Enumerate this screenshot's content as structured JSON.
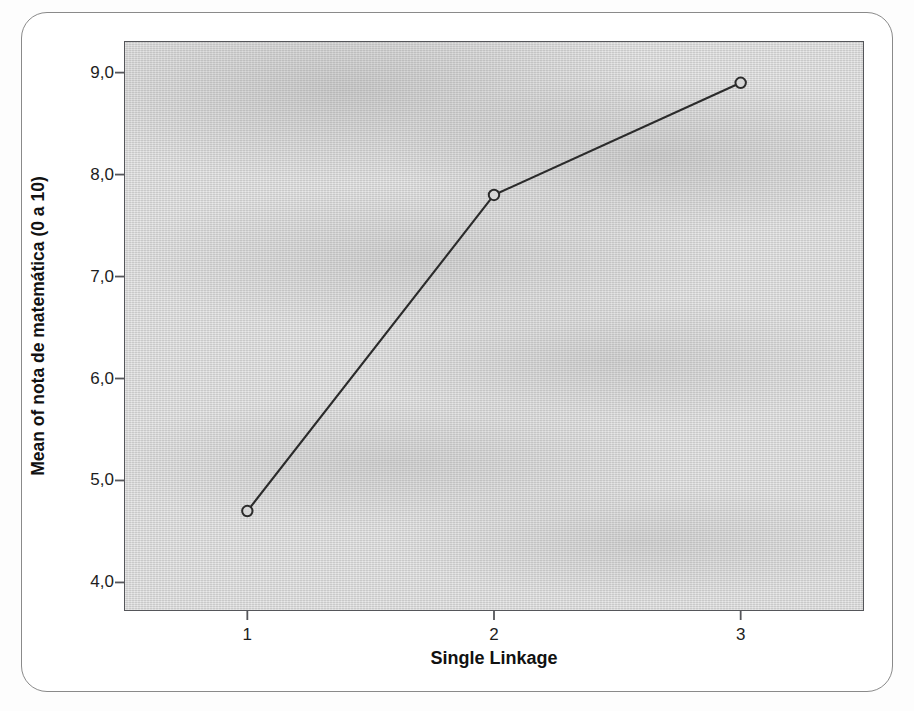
{
  "chart_data": {
    "type": "line",
    "title": "",
    "subtitle": "",
    "xlabel": "Single Linkage",
    "ylabel": "Mean of nota de matemática (0 a 10)",
    "categories": [
      "1",
      "2",
      "3"
    ],
    "x": [
      1,
      2,
      3
    ],
    "values": [
      4.7,
      7.8,
      8.9
    ],
    "series": [
      {
        "name": "Mean of nota de matemática (0 a 10)",
        "values": [
          4.7,
          7.8,
          8.9
        ]
      }
    ],
    "xtick_labels": [
      "1",
      "2",
      "3"
    ],
    "ytick_labels": [
      "4,0",
      "5,0",
      "6,0",
      "7,0",
      "8,0",
      "9,0"
    ],
    "ytick_values": [
      4.0,
      5.0,
      6.0,
      7.0,
      8.0,
      9.0
    ],
    "ylim": [
      3.72,
      9.31
    ],
    "xlim": [
      0.5,
      3.5
    ],
    "grid": false,
    "legend": "none",
    "marker": "open-circle",
    "line_color": "#2b2b2b",
    "marker_color": "#2b2b2b",
    "plot_background": "#d6d6d6",
    "figure_background": "#ffffff",
    "decimal_separator": ","
  },
  "axes": {
    "y_title": "Mean of nota de matemática (0 a 10)",
    "x_title": "Single Linkage"
  }
}
